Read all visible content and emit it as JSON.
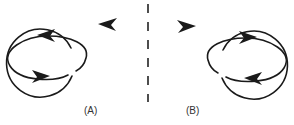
{
  "diagram": {
    "panels": [
      {
        "id": "A",
        "label": "(A)",
        "loops": [
          {
            "shape": "ellipse",
            "arrows": [
              "top-left-pointing",
              "bottom-right-pointing"
            ]
          },
          {
            "shape": "circle",
            "arrows": [
              "top-left-pointing"
            ]
          }
        ],
        "crossing": "ellipse over circle at top, under at bottom"
      },
      {
        "id": "B",
        "label": "(B)",
        "loops": [
          {
            "shape": "circle",
            "arrows": [
              "top-right-pointing"
            ]
          },
          {
            "shape": "ellipse",
            "arrows": [
              "top-right-pointing",
              "bottom-left-pointing"
            ]
          }
        ],
        "crossing": "mirror image of A"
      }
    ],
    "divider": "dashed-vertical-line",
    "colors": {
      "line": "#1a1a1a",
      "background": "#ffffff"
    }
  }
}
